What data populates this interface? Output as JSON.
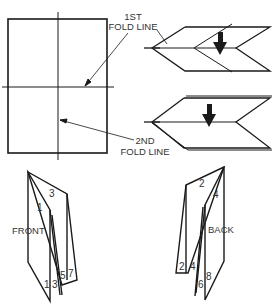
{
  "diagram": {
    "type": "folding-instructions",
    "labels": {
      "first_fold_line_1": "1ST",
      "first_fold_line_2": "FOLD LINE",
      "second_fold_line_1": "2ND",
      "second_fold_line_2": "FOLD LINE",
      "front": "FRONT",
      "back": "BACK"
    },
    "front_pages": {
      "top_1": "1",
      "top_3": "3",
      "bottom": [
        "1",
        "3",
        "5",
        "7"
      ]
    },
    "back_pages": {
      "top_2": "2",
      "top_4": "4",
      "bottom_left": [
        "2",
        "4"
      ],
      "bottom_right": [
        "6",
        "8"
      ]
    },
    "colors": {
      "line": "#1a1a1a",
      "text": "#333333",
      "background": "#ffffff"
    }
  }
}
